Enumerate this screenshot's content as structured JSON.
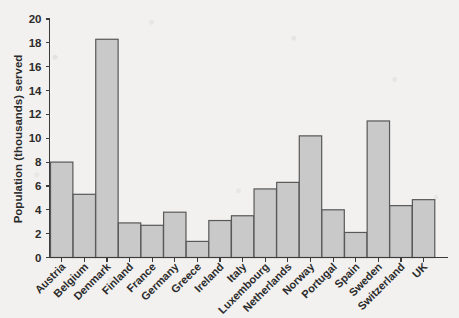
{
  "chart_data": {
    "type": "bar",
    "title": "",
    "subtitle": "",
    "xlabel": "",
    "ylabel": "Population (thousands) served",
    "categories": [
      "Austria",
      "Belgium",
      "Denmark",
      "Finland",
      "France",
      "Germany",
      "Greece",
      "Ireland",
      "Italy",
      "Luxembourg",
      "Netherlands",
      "Norway",
      "Portugal",
      "Spain",
      "Sweden",
      "Switzerland",
      "UK"
    ],
    "values": [
      8.0,
      5.3,
      18.3,
      2.9,
      2.7,
      3.8,
      1.35,
      3.1,
      3.5,
      5.75,
      6.3,
      10.2,
      4.0,
      2.1,
      11.45,
      4.35,
      4.85
    ],
    "ylim": [
      0,
      20
    ],
    "y_ticks": [
      0,
      2,
      4,
      6,
      8,
      10,
      12,
      14,
      16,
      18,
      20
    ],
    "y_tick_labels": [
      "0",
      "2",
      "4",
      "6",
      "8",
      "10",
      "12",
      "14",
      "16",
      "18",
      "20"
    ],
    "grid": false,
    "legend": false,
    "legend_position": "none",
    "bar_color": "#c9c9c9",
    "bar_edge_color": "#585858",
    "axis_color": "#3b3b3b",
    "background_color": "#f2f1ef",
    "x_tick_label_rotation": -45,
    "annotations": []
  }
}
